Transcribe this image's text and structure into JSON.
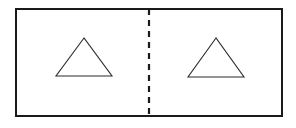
{
  "diagram": {
    "type": "folded-rectangle-with-triangles",
    "outer_rect": {
      "x": 16,
      "y": 9,
      "width": 266,
      "height": 107,
      "stroke": "#1a1a1a"
    },
    "fold_line": {
      "x": 149,
      "style": "dashed",
      "stroke": "#1a1a1a"
    },
    "panels": [
      {
        "name": "left-panel",
        "shape": "triangle",
        "points": [
          [
            84,
            38
          ],
          [
            56,
            76
          ],
          [
            112,
            76
          ]
        ]
      },
      {
        "name": "right-panel",
        "shape": "triangle",
        "points": [
          [
            216,
            38
          ],
          [
            188,
            77
          ],
          [
            244,
            77
          ]
        ]
      }
    ],
    "colors": {
      "stroke": "#1a1a1a",
      "background": "#ffffff"
    }
  }
}
